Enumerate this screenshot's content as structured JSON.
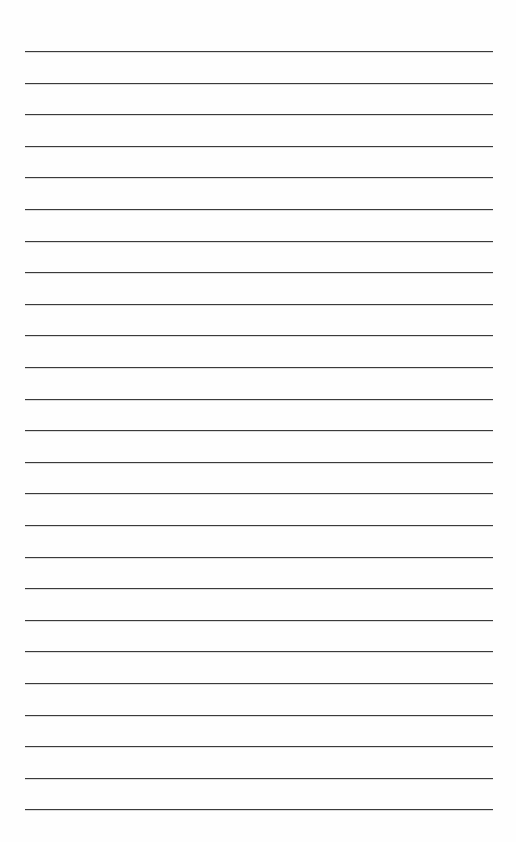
{
  "page": {
    "type": "lined-paper",
    "background_color": "#fefefe",
    "line_color": "#3a3a3a",
    "line_count": 25,
    "first_line_y": 51,
    "line_spacing": 31.6,
    "line_left": 25,
    "line_width": 468
  }
}
